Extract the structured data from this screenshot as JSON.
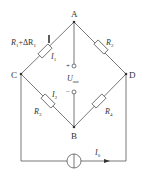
{
  "diagram": {
    "type": "wheatstone-bridge",
    "nodes": {
      "A": "A",
      "B": "B",
      "C": "C",
      "D": "D"
    },
    "resistors": {
      "r1": {
        "name": "R",
        "sub": "1",
        "extra": "+ΔR",
        "extra_sub": "1"
      },
      "r2": {
        "name": "R",
        "sub": "2"
      },
      "r3": {
        "name": "R",
        "sub": "3"
      },
      "r4": {
        "name": "R",
        "sub": "4"
      }
    },
    "currents": {
      "i1": {
        "name": "I",
        "sub": "1"
      },
      "i2": {
        "name": "I",
        "sub": "2"
      },
      "i0": {
        "name": "I",
        "sub": "0"
      }
    },
    "output": {
      "name": "U",
      "sub": "out",
      "plus": "+",
      "minus": "−"
    },
    "colors": {
      "line": "#555555",
      "text": "#333333"
    }
  }
}
